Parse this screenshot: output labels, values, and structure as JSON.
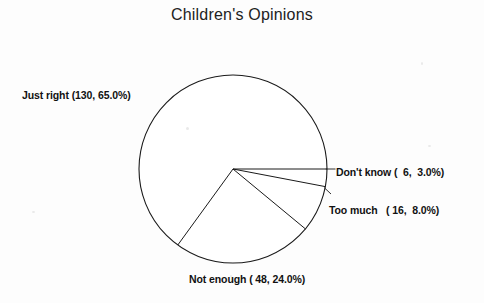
{
  "chart_data": {
    "type": "pie",
    "title": "Children's Opinions",
    "categories": [
      "Don't know",
      "Too much",
      "Not enough",
      "Just right"
    ],
    "values": [
      6,
      16,
      48,
      130
    ],
    "percents": [
      3.0,
      8.0,
      24.0,
      65.0
    ],
    "total": 200,
    "labels": [
      "Don't know (  6,  3.0%)",
      "Too much   ( 16,  8.0%)",
      "Not enough ( 48, 24.0%)",
      "Just right (130, 65.0%)"
    ],
    "slice_colors": [
      "#ffffff",
      "#ffffff",
      "#ffffff",
      "#ffffff"
    ],
    "outline_color": "#1a1a1a",
    "start_angle_deg": 0,
    "direction": "clockwise",
    "legend": "none",
    "grid": false,
    "xlabel": "",
    "ylabel": ""
  },
  "geometry": {
    "center_x": 233,
    "center_y": 169,
    "radius": 94
  },
  "labels": {
    "just_right": "Just right (130, 65.0%)",
    "dont_know": "Don't know (  6,  3.0%)",
    "too_much": "Too much   ( 16,  8.0%)",
    "not_enough": "Not enough ( 48, 24.0%)"
  }
}
